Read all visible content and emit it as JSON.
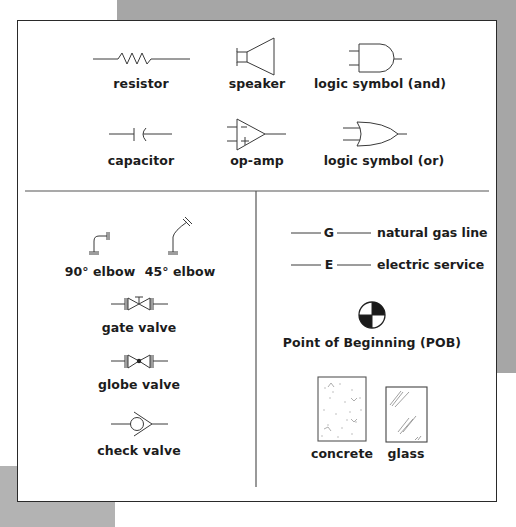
{
  "sections": {
    "electrical": {
      "items": [
        {
          "symbol": "resistor-icon",
          "label": "resistor"
        },
        {
          "symbol": "speaker-icon",
          "label": "speaker"
        },
        {
          "symbol": "and-gate-icon",
          "label": "logic symbol (and)"
        },
        {
          "symbol": "capacitor-icon",
          "label": "capacitor"
        },
        {
          "symbol": "op-amp-icon",
          "label": "op-amp"
        },
        {
          "symbol": "or-gate-icon",
          "label": "logic symbol (or)"
        }
      ],
      "op_amp_inputs": [
        "−",
        "+"
      ]
    },
    "plumbing": {
      "items": [
        {
          "symbol": "elbow-90-icon",
          "label": "90° elbow"
        },
        {
          "symbol": "elbow-45-icon",
          "label": "45° elbow"
        },
        {
          "symbol": "gate-valve-icon",
          "label": "gate valve"
        },
        {
          "symbol": "globe-valve-icon",
          "label": "globe valve"
        },
        {
          "symbol": "check-valve-icon",
          "label": "check valve"
        }
      ]
    },
    "site": {
      "lines": [
        {
          "code": "G",
          "label": "natural gas line"
        },
        {
          "code": "E",
          "label": "electric service"
        }
      ],
      "pob": {
        "symbol": "point-of-beginning-icon",
        "label": "Point of Beginning (POB)"
      },
      "materials": [
        {
          "symbol": "concrete-hatch-icon",
          "label": "concrete"
        },
        {
          "symbol": "glass-hatch-icon",
          "label": "glass"
        }
      ]
    }
  },
  "colors": {
    "line": "#3a3a3a",
    "text": "#1c1c1c",
    "backdrop_gray": "#a6a6a6",
    "frame_border": "#2a2a2a"
  }
}
